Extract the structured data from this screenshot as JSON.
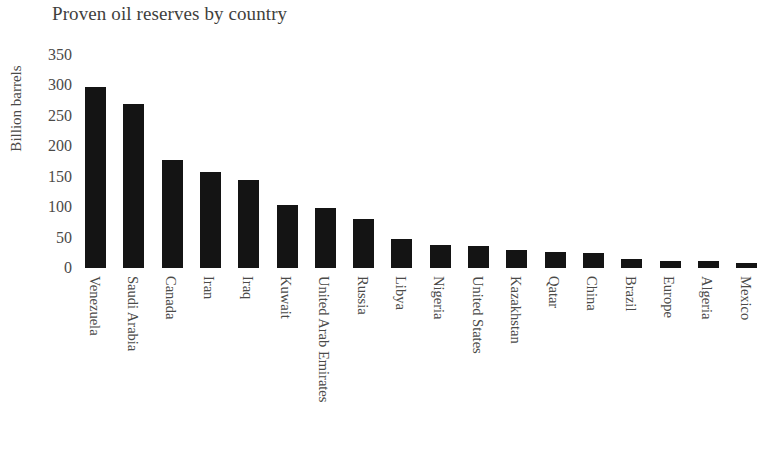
{
  "chart_data": {
    "type": "bar",
    "title": "Proven oil reserves by country",
    "xlabel": "",
    "ylabel": "Billion barrels",
    "ylim": [
      0,
      350
    ],
    "yticks": [
      350,
      300,
      250,
      200,
      150,
      100,
      50,
      0
    ],
    "grid": false,
    "legend": null,
    "orientation": "vertical",
    "bar_color": "#141414",
    "background_color": "#ffffff",
    "categories": [
      "Venezuela",
      "Saudi Arabia",
      "Canada",
      "Iran",
      "Iraq",
      "Kuwait",
      "United Arab Emirates",
      "Russia",
      "Libya",
      "Nigeria",
      "United States",
      "Kazakhstan",
      "Qatar",
      "China",
      "Brazil",
      "Europe",
      "Algeria",
      "Mexico"
    ],
    "values": [
      298,
      270,
      178,
      158,
      144,
      104,
      98,
      80,
      48,
      37,
      36,
      30,
      26,
      25,
      15,
      12,
      12,
      8
    ]
  }
}
